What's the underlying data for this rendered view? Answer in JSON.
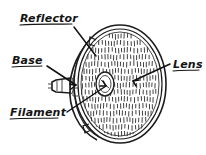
{
  "figure": {
    "kind": "hand-drawn-diagram",
    "background_color": "#ffffff",
    "ink_color": "#1a1a1a"
  },
  "labels": [
    {
      "id": "reflector",
      "text": "Reflector",
      "underlined": true,
      "position": "top-left",
      "leader": "points down-right to the reflector shell behind the lens"
    },
    {
      "id": "base",
      "text": "Base",
      "underlined": true,
      "position": "middle-left",
      "leader": "points right to the socket stub at the rear of the lamp"
    },
    {
      "id": "filament",
      "text": "Filament",
      "underlined": true,
      "position": "bottom-left",
      "leader": "points up-right to the small capsule at the lens center"
    },
    {
      "id": "lens",
      "text": "Lens",
      "underlined": true,
      "position": "middle-right",
      "leader": "points left to the prismatic lens face"
    }
  ],
  "parts": [
    {
      "id": "lens-face",
      "name": "Lens",
      "description": "large ellipse covered in rows of short vertical prism hatch marks"
    },
    {
      "id": "reflector-shell",
      "name": "Reflector",
      "description": "curved parabolic shell drawn behind and left of the lens face"
    },
    {
      "id": "rim",
      "name": "Rim",
      "description": "double outline around the lens ellipse"
    },
    {
      "id": "mounting-tabs",
      "name": "Mounting tabs",
      "description": "small clip tabs on the upper and lower left of the rim"
    },
    {
      "id": "base-stub",
      "name": "Base",
      "description": "short cylindrical socket protruding from the rear center"
    },
    {
      "id": "filament-capsule",
      "name": "Filament",
      "description": "small white oval at the optical center of the lens"
    }
  ]
}
